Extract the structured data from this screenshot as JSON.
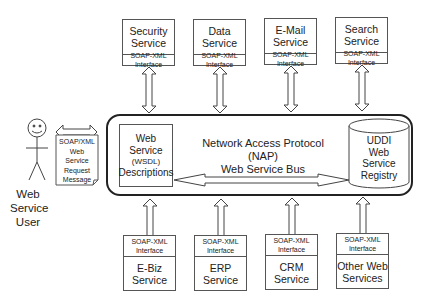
{
  "diagram": {
    "title": "Network Access Protocol (NAP) Web Service Bus",
    "bus": {
      "title_line1": "Network Access Protocol (NAP)",
      "title_line2": "Web Service Bus"
    },
    "wsdl": {
      "line1": "Web",
      "line2": "Service",
      "line3": "(WSDL)",
      "line4": "Descriptions"
    },
    "uddi": {
      "line1": "UDDI",
      "line2": "Web",
      "line3": "Service",
      "line4": "Registry"
    },
    "user": {
      "line1": "Web",
      "line2": "Service",
      "line3": "User"
    },
    "request_message": {
      "line1": "SOAP/XML",
      "line2": "Web",
      "line3": "Service",
      "line4": "Request",
      "line5": "Message"
    },
    "top_services": [
      {
        "line1": "Security",
        "line2": "Service",
        "iface1": "SOAP-XML",
        "iface2": "Interface"
      },
      {
        "line1": "Data",
        "line2": "Service",
        "iface1": "SOAP-XML",
        "iface2": "Interface"
      },
      {
        "line1": "E-Mail",
        "line2": "Service",
        "iface1": "SOAP-XML",
        "iface2": "Interface"
      },
      {
        "line1": "Search",
        "line2": "Service",
        "iface1": "SOAP-XML",
        "iface2": "Interface"
      }
    ],
    "bottom_services": [
      {
        "line1": "E-Biz",
        "line2": "Service",
        "iface1": "SOAP-XML",
        "iface2": "Interface"
      },
      {
        "line1": "ERP",
        "line2": "Service",
        "iface1": "SOAP-XML",
        "iface2": "Interface"
      },
      {
        "line1": "CRM",
        "line2": "Service",
        "iface1": "SOAP-XML",
        "iface2": "Interface"
      },
      {
        "line1": "Other Web",
        "line2": "Services",
        "iface1": "SOAP-XML",
        "iface2": "Interface"
      }
    ]
  }
}
